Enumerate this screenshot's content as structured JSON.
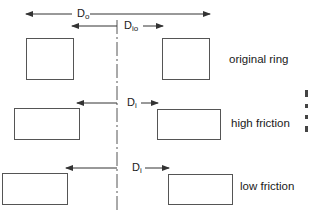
{
  "diagram": {
    "colors": {
      "stroke": "#555555",
      "text": "#1a1a1a",
      "background": "#ffffff"
    },
    "centerline": {
      "x": 117,
      "style": "dash-dot"
    },
    "dimensions": {
      "outer": {
        "main": "D",
        "sub": "o"
      },
      "inner_original": {
        "main": "D",
        "sub": "io"
      },
      "inner_high": {
        "main": "D",
        "sub": "i"
      },
      "inner_low": {
        "main": "D",
        "sub": "i"
      }
    },
    "states": [
      {
        "label": "original ring"
      },
      {
        "label": "high friction"
      },
      {
        "label": "low friction"
      }
    ]
  }
}
